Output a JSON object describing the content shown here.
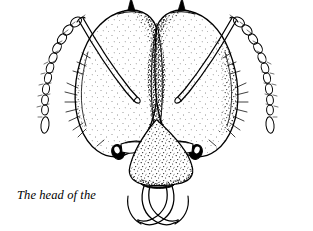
{
  "figure": {
    "title": "The head of the leaf-cutting ant",
    "view": "anterior (front) view",
    "style": "pen-and-ink stipple line drawing",
    "background_color": "#ffffff",
    "ink_color": "#000000",
    "caption": {
      "line1": "The head of the",
      "line2": "leaf-cutting ant"
    },
    "parts": [
      {
        "name": "occipital-spine-left",
        "label": "occipital spine (left)"
      },
      {
        "name": "occipital-spine-right",
        "label": "occipital spine (right)"
      },
      {
        "name": "head-lobe-left",
        "label": "left head lobe"
      },
      {
        "name": "head-lobe-right",
        "label": "right head lobe"
      },
      {
        "name": "frontal-furrow",
        "label": "median frontal furrow"
      },
      {
        "name": "antennal-scape-left",
        "label": "left antennal scape"
      },
      {
        "name": "antennal-scape-right",
        "label": "right antennal scape"
      },
      {
        "name": "antenna-left",
        "label": "left antenna funiculus"
      },
      {
        "name": "antenna-right",
        "label": "right antenna funiculus"
      },
      {
        "name": "eye-left",
        "label": "left compound eye"
      },
      {
        "name": "eye-right",
        "label": "right compound eye"
      },
      {
        "name": "clypeus",
        "label": "clypeus"
      },
      {
        "name": "mandible-left",
        "label": "left mandible"
      },
      {
        "name": "mandible-right",
        "label": "right mandible"
      },
      {
        "name": "setae",
        "label": "setae (hairs)"
      }
    ]
  }
}
